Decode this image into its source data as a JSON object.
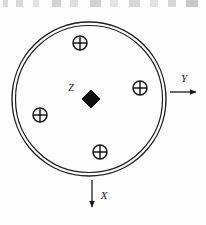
{
  "figure": {
    "background_color": "#fefefe",
    "ink_color": "#1a1a1a",
    "boundary": {
      "name": "double-line circle",
      "center_x": 89,
      "center_y": 99,
      "outer_radius": 77,
      "inner_radius": 73.5,
      "stroke_color": "#1f1f1f"
    },
    "center_marker": {
      "shape": "filled-diamond",
      "label": "Z",
      "label_x": 71,
      "label_y": 91,
      "center_x": 91,
      "center_y": 99,
      "half_size": 9,
      "fill_color": "#0d0d0d"
    },
    "markers": [
      {
        "label": "⊕",
        "name": "crossed-circle-top",
        "cx": 80,
        "cy": 43,
        "r": 7
      },
      {
        "label": "⊕",
        "name": "crossed-circle-right",
        "cx": 140,
        "cy": 88,
        "r": 7
      },
      {
        "label": "⊕",
        "name": "crossed-circle-left",
        "cx": 40,
        "cy": 115,
        "r": 7
      },
      {
        "label": "⊕",
        "name": "crossed-circle-bottom",
        "cx": 100,
        "cy": 152,
        "r": 7
      }
    ],
    "axes": [
      {
        "label": "Y",
        "name": "axis-y",
        "direction": "right",
        "x1": 170,
        "y1": 92,
        "x2": 196,
        "y2": 92,
        "label_x": 184,
        "label_y": 82
      },
      {
        "label": "X",
        "name": "axis-x",
        "direction": "down",
        "x1": 92,
        "y1": 180,
        "x2": 92,
        "y2": 207,
        "label_x": 104,
        "label_y": 199
      }
    ]
  }
}
